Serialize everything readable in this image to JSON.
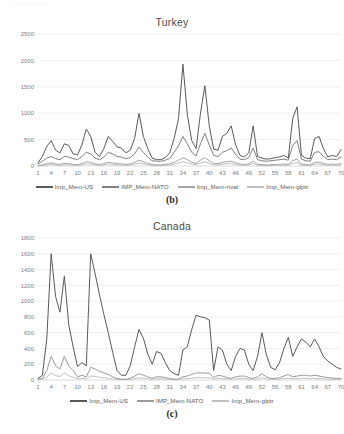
{
  "scan_artifact_text": "- - --  -- -- --- ---",
  "figures": [
    {
      "id": "figure-b",
      "label": "(b)",
      "chart_data": {
        "type": "line",
        "title": "Turkey",
        "xlabel": "",
        "ylabel": "",
        "xlim": [
          1,
          70
        ],
        "ylim": [
          0,
          2500
        ],
        "ytick_values": [
          0,
          500,
          1000,
          1500,
          2000,
          2500
        ],
        "ytick_labels": [
          "0",
          "500",
          "1000",
          "1500",
          "2000",
          "2500"
        ],
        "xtick_values": [
          1,
          4,
          7,
          10,
          13,
          16,
          19,
          22,
          25,
          28,
          31,
          34,
          37,
          40,
          43,
          46,
          49,
          52,
          55,
          58,
          61,
          64,
          67,
          70
        ],
        "xtick_labels": [
          "1",
          "4",
          "7",
          "10",
          "13",
          "16",
          "19",
          "22",
          "25",
          "28",
          "31",
          "34",
          "37",
          "40",
          "43",
          "46",
          "49",
          "52",
          "55",
          "58",
          "61",
          "64",
          "67",
          "70"
        ],
        "grid": true,
        "legend_position": "bottom",
        "x": [
          1,
          2,
          3,
          4,
          5,
          6,
          7,
          8,
          9,
          10,
          11,
          12,
          13,
          14,
          15,
          16,
          17,
          18,
          19,
          20,
          21,
          22,
          23,
          24,
          25,
          26,
          27,
          28,
          29,
          30,
          31,
          32,
          33,
          34,
          35,
          36,
          37,
          38,
          39,
          40,
          41,
          42,
          43,
          44,
          45,
          46,
          47,
          48,
          49,
          50,
          51,
          52,
          53,
          54,
          55,
          56,
          57,
          58,
          59,
          60,
          61,
          62,
          63,
          64,
          65,
          66,
          67,
          68,
          69,
          70
        ],
        "series": [
          {
            "name": "Imp_Mem-US",
            "color": "#595959",
            "values": [
              60,
              180,
              370,
              480,
              300,
              250,
              420,
              390,
              230,
              210,
              400,
              700,
              560,
              260,
              180,
              330,
              560,
              470,
              360,
              340,
              250,
              300,
              520,
              1000,
              560,
              330,
              150,
              120,
              120,
              160,
              250,
              520,
              900,
              1930,
              980,
              480,
              330,
              1000,
              1520,
              760,
              320,
              300,
              560,
              620,
              760,
              400,
              200,
              170,
              250,
              760,
              180,
              150,
              130,
              140,
              160,
              170,
              200,
              150,
              900,
              1120,
              200,
              150,
              140,
              520,
              560,
              330,
              170,
              200,
              180,
              310
            ]
          },
          {
            "name": "IMP_Mem-NATO",
            "color": "#808080",
            "values": [
              40,
              90,
              150,
              180,
              140,
              120,
              180,
              170,
              140,
              120,
              180,
              260,
              230,
              150,
              120,
              170,
              260,
              230,
              180,
              170,
              140,
              160,
              230,
              360,
              260,
              170,
              100,
              90,
              90,
              110,
              140,
              260,
              380,
              560,
              420,
              260,
              190,
              420,
              620,
              400,
              200,
              180,
              260,
              290,
              340,
              220,
              130,
              120,
              160,
              340,
              120,
              100,
              90,
              100,
              110,
              120,
              130,
              110,
              390,
              480,
              130,
              100,
              90,
              260,
              270,
              180,
              120,
              130,
              120,
              170
            ]
          },
          {
            "name": "Imp_Mem-rival",
            "color": "#a6a6a6",
            "values": [
              10,
              20,
              40,
              60,
              40,
              30,
              50,
              45,
              30,
              25,
              45,
              80,
              70,
              40,
              30,
              45,
              70,
              60,
              45,
              40,
              30,
              40,
              70,
              110,
              80,
              50,
              25,
              20,
              20,
              30,
              40,
              70,
              110,
              160,
              120,
              70,
              50,
              110,
              160,
              100,
              50,
              45,
              70,
              80,
              90,
              60,
              35,
              30,
              40,
              90,
              30,
              25,
              20,
              25,
              30,
              30,
              35,
              30,
              100,
              130,
              35,
              25,
              20,
              70,
              75,
              50,
              30,
              35,
              30,
              45
            ]
          },
          {
            "name": "Imp_Mem-glptr",
            "color": "#bfbfbf",
            "values": [
              5,
              10,
              20,
              30,
              20,
              15,
              25,
              22,
              15,
              12,
              22,
              40,
              35,
              20,
              15,
              22,
              35,
              30,
              22,
              20,
              15,
              20,
              35,
              55,
              40,
              25,
              12,
              10,
              10,
              15,
              20,
              35,
              55,
              80,
              60,
              35,
              25,
              55,
              80,
              50,
              25,
              22,
              35,
              40,
              45,
              30,
              18,
              15,
              20,
              45,
              15,
              12,
              10,
              12,
              15,
              15,
              18,
              15,
              50,
              65,
              18,
              12,
              10,
              35,
              38,
              25,
              15,
              18,
              15,
              22
            ]
          }
        ]
      }
    },
    {
      "id": "figure-c",
      "label": "(c)",
      "chart_data": {
        "type": "line",
        "title": "Canada",
        "xlabel": "",
        "ylabel": "",
        "xlim": [
          1,
          70
        ],
        "ylim": [
          0,
          1800
        ],
        "ytick_values": [
          0,
          200,
          400,
          600,
          800,
          1000,
          1200,
          1400,
          1600,
          1800
        ],
        "ytick_labels": [
          "0",
          "200",
          "400",
          "600",
          "800",
          "1000",
          "1200",
          "1400",
          "1600",
          "1800"
        ],
        "xtick_values": [
          1,
          4,
          7,
          10,
          13,
          16,
          19,
          22,
          25,
          28,
          31,
          34,
          37,
          40,
          43,
          46,
          49,
          52,
          55,
          58,
          61,
          64,
          67,
          70
        ],
        "xtick_labels": [
          "1",
          "4",
          "7",
          "10",
          "13",
          "16",
          "19",
          "22",
          "25",
          "28",
          "31",
          "34",
          "37",
          "40",
          "43",
          "46",
          "49",
          "52",
          "55",
          "58",
          "61",
          "64",
          "67",
          "70"
        ],
        "grid": true,
        "legend_position": "bottom",
        "x": [
          1,
          2,
          3,
          4,
          5,
          6,
          7,
          8,
          9,
          10,
          11,
          12,
          13,
          14,
          15,
          16,
          17,
          18,
          19,
          20,
          21,
          22,
          23,
          24,
          25,
          26,
          27,
          28,
          29,
          30,
          31,
          32,
          33,
          34,
          35,
          36,
          37,
          38,
          39,
          40,
          41,
          42,
          43,
          44,
          45,
          46,
          47,
          48,
          49,
          50,
          51,
          52,
          53,
          54,
          55,
          56,
          57,
          58,
          59,
          60,
          61,
          62,
          63,
          64,
          65,
          66,
          67,
          68,
          69,
          70
        ],
        "series": [
          {
            "name": "Imp_Mem-US",
            "color": "#595959",
            "values": [
              20,
              60,
              520,
              1600,
              1060,
              860,
              1320,
              700,
              420,
              170,
              220,
              180,
              1600,
              1350,
              1080,
              830,
              600,
              350,
              120,
              60,
              60,
              180,
              420,
              640,
              530,
              330,
              200,
              360,
              340,
              220,
              120,
              80,
              60,
              380,
              420,
              640,
              820,
              800,
              790,
              760,
              120,
              420,
              380,
              200,
              120,
              300,
              400,
              380,
              200,
              120,
              300,
              600,
              320,
              160,
              130,
              220,
              400,
              540,
              300,
              420,
              520,
              480,
              420,
              520,
              420,
              300,
              240,
              200,
              160,
              140
            ]
          },
          {
            "name": "IMP_Mem-NATO",
            "color": "#9a9a9a",
            "values": [
              10,
              20,
              120,
              300,
              180,
              140,
              300,
              180,
              120,
              40,
              60,
              40,
              160,
              140,
              110,
              90,
              70,
              40,
              20,
              10,
              10,
              20,
              50,
              80,
              60,
              40,
              20,
              40,
              40,
              30,
              20,
              10,
              10,
              40,
              50,
              70,
              90,
              90,
              90,
              85,
              30,
              60,
              50,
              30,
              20,
              40,
              50,
              50,
              30,
              20,
              40,
              80,
              40,
              20,
              20,
              30,
              50,
              70,
              40,
              50,
              60,
              60,
              50,
              60,
              50,
              40,
              30,
              25,
              20,
              20
            ]
          },
          {
            "name": "Imp_Mem-glptr",
            "color": "#c0c0c0",
            "values": [
              5,
              10,
              40,
              90,
              55,
              45,
              90,
              55,
              35,
              15,
              20,
              15,
              50,
              45,
              35,
              28,
              22,
              14,
              8,
              5,
              5,
              8,
              18,
              26,
              20,
              14,
              8,
              14,
              14,
              10,
              8,
              5,
              5,
              14,
              18,
              24,
              30,
              30,
              30,
              28,
              12,
              22,
              18,
              12,
              8,
              14,
              18,
              18,
              12,
              8,
              14,
              28,
              14,
              8,
              8,
              12,
              18,
              24,
              14,
              18,
              22,
              22,
              18,
              22,
              18,
              14,
              10,
              9,
              8,
              8
            ]
          }
        ]
      }
    }
  ]
}
